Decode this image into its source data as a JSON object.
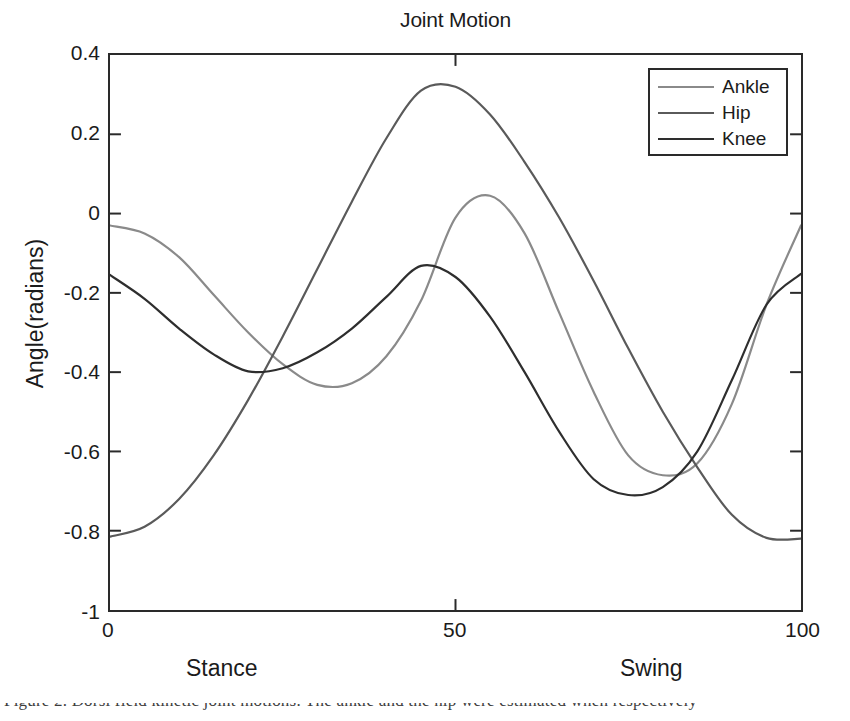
{
  "figure": {
    "title": "Joint Motion",
    "background_color": "#ffffff",
    "axis_color": "#2a2a2a"
  },
  "axes": {
    "y_label": "Angle(radians)",
    "y_ticks": [
      "0.4",
      "0.2",
      "0",
      "-0.2",
      "-0.4",
      "-0.6",
      "-0.8",
      "-1"
    ],
    "x_ticks": [
      "0",
      "50",
      "100"
    ],
    "phase_labels": {
      "stance": "Stance",
      "swing": "Swing"
    }
  },
  "legend": {
    "position": "top-right",
    "entries": [
      {
        "label": "Ankle",
        "color": "#8a8a8a"
      },
      {
        "label": "Hip",
        "color": "#5a5a5a"
      },
      {
        "label": "Knee",
        "color": "#2e2e2e"
      }
    ]
  },
  "page_text": {
    "caption_fragment": "Figure 2. Dorsi field kinetic joint motions. The ankle and the hip were estimated when respectively"
  },
  "chart_data": {
    "type": "line",
    "title": "Joint Motion",
    "xlabel": "",
    "ylabel": "Angle(radians)",
    "xlim": [
      0,
      100
    ],
    "ylim": [
      -1,
      0.4
    ],
    "grid": false,
    "legend_position": "upper right",
    "x_tick_values": [
      0,
      50,
      100
    ],
    "y_tick_values": [
      0.4,
      0.2,
      0,
      -0.2,
      -0.4,
      -0.6,
      -0.8,
      -1
    ],
    "x": [
      0,
      5,
      10,
      15,
      20,
      25,
      30,
      35,
      40,
      45,
      50,
      55,
      60,
      65,
      70,
      75,
      80,
      85,
      90,
      95,
      100
    ],
    "series": [
      {
        "name": "Ankle",
        "color": "#8a8a8a",
        "values": [
          -0.03,
          -0.05,
          -0.11,
          -0.205,
          -0.3,
          -0.38,
          -0.432,
          -0.428,
          -0.36,
          -0.22,
          -0.01,
          0.045,
          -0.05,
          -0.25,
          -0.45,
          -0.61,
          -0.66,
          -0.63,
          -0.48,
          -0.23,
          -0.03
        ]
      },
      {
        "name": "Hip",
        "color": "#5a5a5a",
        "values": [
          -0.815,
          -0.79,
          -0.72,
          -0.61,
          -0.47,
          -0.31,
          -0.14,
          0.03,
          0.19,
          0.31,
          0.32,
          0.25,
          0.13,
          -0.01,
          -0.17,
          -0.34,
          -0.5,
          -0.64,
          -0.76,
          -0.818,
          -0.82
        ]
      },
      {
        "name": "Knee",
        "color": "#2e2e2e",
        "values": [
          -0.155,
          -0.215,
          -0.29,
          -0.355,
          -0.398,
          -0.39,
          -0.35,
          -0.29,
          -0.21,
          -0.132,
          -0.16,
          -0.26,
          -0.4,
          -0.55,
          -0.67,
          -0.71,
          -0.69,
          -0.6,
          -0.42,
          -0.23,
          -0.152
        ]
      }
    ],
    "annotations": [
      {
        "text": "Stance",
        "region": "left half of x axis"
      },
      {
        "text": "Swing",
        "region": "right portion of x axis"
      }
    ]
  }
}
